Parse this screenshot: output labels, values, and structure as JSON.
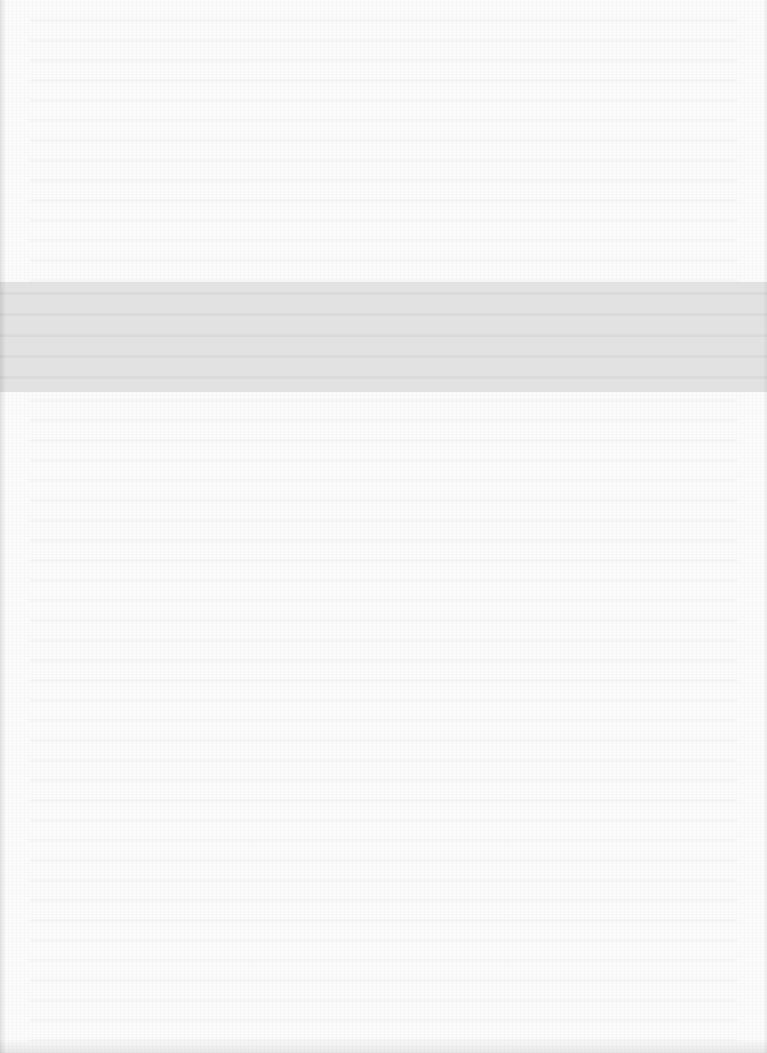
{
  "page": {
    "type": "scanned-blank-page",
    "background_color": "#fbfbfb",
    "band": {
      "color": "#e2e2e2",
      "top_px": 282,
      "height_px": 110
    },
    "text": ""
  }
}
